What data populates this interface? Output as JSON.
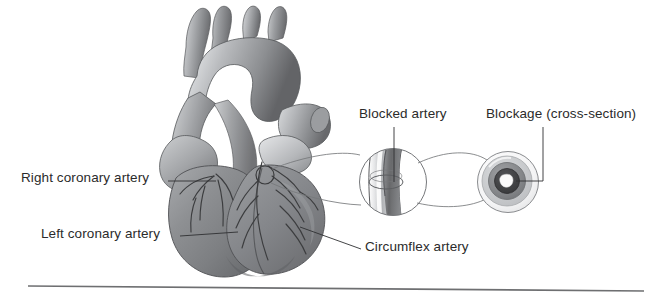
{
  "figure": {
    "background_color": "#ffffff",
    "text_color": "#2b2b2b"
  },
  "labels": {
    "right_coronary_artery": "Right coronary artery",
    "left_coronary_artery": "Left coronary artery",
    "circumflex_artery": "Circumflex artery",
    "blocked_artery": "Blocked artery",
    "blockage_cross_section": "Blockage (cross-section)"
  },
  "illustration": {
    "heart": {
      "name": "anterior view of human heart with coronary vessels",
      "fill_dark": "#6f7073",
      "fill_mid": "#8b8d90",
      "fill_light": "#b9bbbe",
      "fill_highlight": "#d8dadc",
      "outline": "#4a4b4d"
    },
    "blockage_marker": {
      "name": "small circle on heart marking blockage site",
      "cx": 265,
      "cy": 175,
      "r": 9
    },
    "magnified_artery": {
      "name": "magnified blocked artery segment",
      "cx": 393,
      "cy": 182,
      "r": 34,
      "vessel_fill": "#cfd1d3",
      "plaque_fill": "#7e8083"
    },
    "cross_section": {
      "name": "arterial cross-section showing narrowed lumen",
      "cx": 508,
      "cy": 182,
      "r": 31,
      "rings": [
        {
          "label": "vessel wall",
          "radius": 31,
          "color": "#f2f2f2"
        },
        {
          "label": "outer wall shading",
          "radius": 26,
          "color": "#c9cbcd"
        },
        {
          "label": "plaque",
          "radius": 19,
          "color": "#8a8c8f"
        },
        {
          "label": "inner plaque",
          "radius": 13,
          "color": "#3d3e40"
        },
        {
          "label": "lumen",
          "radius": 6,
          "color": "#fbfbfb"
        }
      ]
    },
    "baseline_rule": {
      "name": "horizontal rule at bottom of figure",
      "x1": 28,
      "y1": 286,
      "x2": 644,
      "y2": 291,
      "color": "#6e6f71"
    }
  }
}
